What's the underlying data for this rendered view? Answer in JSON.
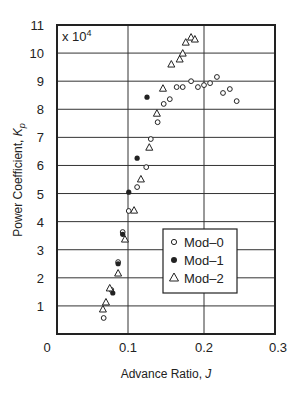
{
  "chart_data": {
    "type": "scatter",
    "title": "",
    "xlabel": "Advance Ratio, J",
    "xlabel_main": "Advance Ratio, ",
    "xlabel_var": "J",
    "ylabel": "Power Coefficient, Kp",
    "ylabel_main": "Power Coefficient, ",
    "ylabel_var": "K",
    "ylabel_sub": "p",
    "y_multiplier": "x 10",
    "y_multiplier_exp": "4",
    "xlim": [
      0,
      0.3
    ],
    "ylim": [
      0,
      11
    ],
    "x_ticks": [
      0,
      0.1,
      0.2,
      0.3
    ],
    "x_tick_labels": [
      "0",
      "0.1",
      "0.2",
      "0.3"
    ],
    "y_ticks": [
      1,
      2,
      3,
      4,
      5,
      6,
      7,
      8,
      9,
      10,
      11
    ],
    "y_tick_labels": [
      "1",
      "2",
      "3",
      "4",
      "5",
      "6",
      "7",
      "8",
      "9",
      "10",
      "11"
    ],
    "grid": true,
    "legend_position": "lower right",
    "series": [
      {
        "name": "Mod–0",
        "marker": "open-circle",
        "x": [
          0.068,
          0.078,
          0.087,
          0.093,
          0.101,
          0.112,
          0.124,
          0.13,
          0.139,
          0.147,
          0.155,
          0.164,
          0.172,
          0.183,
          0.192,
          0.2,
          0.208,
          0.217,
          0.225,
          0.234,
          0.243
        ],
        "y": [
          0.57,
          1.57,
          2.56,
          3.63,
          4.38,
          5.23,
          5.94,
          6.94,
          7.54,
          8.19,
          8.36,
          8.79,
          8.79,
          9.0,
          8.79,
          8.86,
          8.93,
          9.15,
          8.58,
          8.72,
          8.29
        ]
      },
      {
        "name": "Mod–1",
        "marker": "filled-circle",
        "x": [
          0.08,
          0.087,
          0.093,
          0.101,
          0.112,
          0.125
        ],
        "y": [
          1.46,
          2.5,
          3.55,
          5.05,
          6.26,
          8.43
        ]
      },
      {
        "name": "Mod–2",
        "marker": "open-triangle",
        "x": [
          0.067,
          0.071,
          0.076,
          0.087,
          0.096,
          0.108,
          0.117,
          0.128,
          0.138,
          0.146,
          0.157,
          0.168,
          0.172,
          0.176,
          0.183,
          0.188
        ],
        "y": [
          0.89,
          1.14,
          1.64,
          2.17,
          3.38,
          4.41,
          5.52,
          6.65,
          7.86,
          8.75,
          9.61,
          9.79,
          10.0,
          10.39,
          10.57,
          10.5
        ]
      }
    ]
  },
  "legend": {
    "items": [
      {
        "label": "Mod–0",
        "marker": "open-circle"
      },
      {
        "label": "Mod–1",
        "marker": "filled-circle"
      },
      {
        "label": "Mod–2",
        "marker": "open-triangle"
      }
    ]
  },
  "colors": {
    "ink": "#222222",
    "grid": "#333333",
    "background": "#ffffff"
  }
}
